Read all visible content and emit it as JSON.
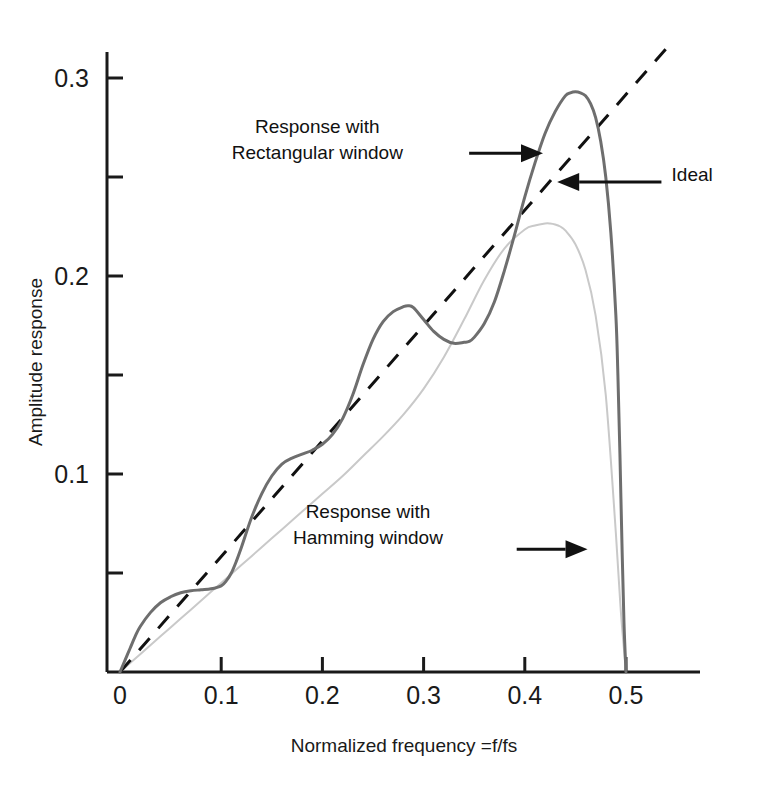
{
  "chart_data": {
    "type": "line",
    "title": "",
    "xlabel": "Normalized frequency =f/fs",
    "ylabel": "Amplitude response",
    "xlim": [
      0,
      0.575
    ],
    "ylim": [
      0,
      0.33
    ],
    "xticks": [
      0,
      0.1,
      0.2,
      0.3,
      0.4,
      0.5
    ],
    "xtick_labels": [
      "0",
      "0.1",
      "0.2",
      "0.3",
      "0.4",
      "0.5"
    ],
    "yticks": [
      0.05,
      0.1,
      0.15,
      0.2,
      0.25,
      0.3
    ],
    "ytick_labels": [
      "",
      "0.1",
      "",
      "0.2",
      "",
      "0.3"
    ],
    "grid": false,
    "legend": "none (inline annotations with arrows)",
    "series": [
      {
        "name": "Response with Rectangular window",
        "color": "#6e6e6e",
        "style": "solid",
        "width": 3,
        "x": [
          0.0,
          0.005,
          0.01,
          0.015,
          0.02,
          0.03,
          0.04,
          0.05,
          0.06,
          0.07,
          0.08,
          0.09,
          0.1,
          0.105,
          0.11,
          0.115,
          0.12,
          0.13,
          0.14,
          0.15,
          0.16,
          0.17,
          0.18,
          0.19,
          0.2,
          0.21,
          0.22,
          0.23,
          0.24,
          0.25,
          0.26,
          0.27,
          0.28,
          0.285,
          0.29,
          0.3,
          0.31,
          0.32,
          0.33,
          0.34,
          0.345,
          0.35,
          0.36,
          0.37,
          0.38,
          0.39,
          0.4,
          0.41,
          0.42,
          0.43,
          0.44,
          0.445,
          0.45,
          0.455,
          0.46,
          0.465,
          0.47,
          0.475,
          0.48,
          0.485,
          0.49,
          0.492,
          0.494,
          0.496,
          0.498,
          0.5
        ],
        "y": [
          0.0,
          0.006,
          0.012,
          0.018,
          0.023,
          0.03,
          0.035,
          0.038,
          0.04,
          0.041,
          0.0415,
          0.042,
          0.0435,
          0.046,
          0.05,
          0.056,
          0.063,
          0.078,
          0.09,
          0.099,
          0.105,
          0.108,
          0.11,
          0.112,
          0.115,
          0.12,
          0.128,
          0.14,
          0.155,
          0.168,
          0.177,
          0.182,
          0.1845,
          0.185,
          0.184,
          0.178,
          0.172,
          0.168,
          0.166,
          0.1665,
          0.167,
          0.169,
          0.176,
          0.187,
          0.203,
          0.221,
          0.24,
          0.257,
          0.272,
          0.283,
          0.291,
          0.2925,
          0.293,
          0.2925,
          0.291,
          0.287,
          0.28,
          0.268,
          0.25,
          0.222,
          0.18,
          0.15,
          0.11,
          0.065,
          0.025,
          0.0
        ]
      },
      {
        "name": "Response with Hamming window",
        "color": "#c9c9c9",
        "style": "solid",
        "width": 2,
        "x": [
          0.0,
          0.02,
          0.04,
          0.06,
          0.08,
          0.1,
          0.12,
          0.14,
          0.16,
          0.18,
          0.2,
          0.22,
          0.24,
          0.26,
          0.28,
          0.3,
          0.32,
          0.34,
          0.36,
          0.38,
          0.4,
          0.41,
          0.42,
          0.425,
          0.43,
          0.435,
          0.44,
          0.45,
          0.46,
          0.47,
          0.48,
          0.49,
          0.495,
          0.5
        ],
        "y": [
          0.0,
          0.009,
          0.018,
          0.027,
          0.036,
          0.045,
          0.054,
          0.063,
          0.072,
          0.081,
          0.09,
          0.099,
          0.109,
          0.119,
          0.13,
          0.143,
          0.159,
          0.178,
          0.198,
          0.214,
          0.2235,
          0.2255,
          0.2265,
          0.2265,
          0.226,
          0.225,
          0.223,
          0.216,
          0.203,
          0.18,
          0.14,
          0.07,
          0.03,
          0.0
        ]
      },
      {
        "name": "Ideal",
        "color": "#111111",
        "style": "dashed",
        "width": 3,
        "x": [
          0.0,
          0.54
        ],
        "y": [
          0.0,
          0.315
        ]
      }
    ],
    "annotations": [
      {
        "id": "rectangular-window-annotation",
        "lines": [
          "Response with",
          "Rectangular window"
        ],
        "text_anchor_x": 0.195,
        "text_anchor_y": 0.272,
        "arrow_from": [
          0.345,
          0.262
        ],
        "arrow_to": [
          0.418,
          0.262
        ]
      },
      {
        "id": "ideal-annotation",
        "lines": [
          "Ideal"
        ],
        "text_anchor_x": 0.545,
        "text_anchor_y": 0.248,
        "arrow_from": [
          0.535,
          0.2475
        ],
        "arrow_to": [
          0.432,
          0.2475
        ]
      },
      {
        "id": "hamming-window-annotation",
        "lines": [
          "Response with",
          "Hamming window"
        ],
        "text_anchor_x": 0.245,
        "text_anchor_y": 0.078,
        "arrow_from": [
          0.392,
          0.062
        ],
        "arrow_to": [
          0.462,
          0.062
        ]
      }
    ]
  },
  "axes": {
    "x_axis_label": "Normalized frequency =f/fs",
    "y_axis_label": "Amplitude response",
    "x_tick_labels": [
      "0",
      "0.1",
      "0.2",
      "0.3",
      "0.4",
      "0.5"
    ],
    "y_tick_labels": [
      "0.1",
      "0.2",
      "0.3"
    ]
  },
  "annotations_text": {
    "rect_line1": "Response with",
    "rect_line2": "Rectangular window",
    "ideal": "Ideal",
    "hamming_line1": "Response with",
    "hamming_line2": "Hamming window"
  },
  "colors": {
    "rectangular": "#6e6e6e",
    "hamming": "#c9c9c9",
    "ideal": "#111111",
    "axis": "#1a1a1a",
    "background": "#ffffff"
  }
}
